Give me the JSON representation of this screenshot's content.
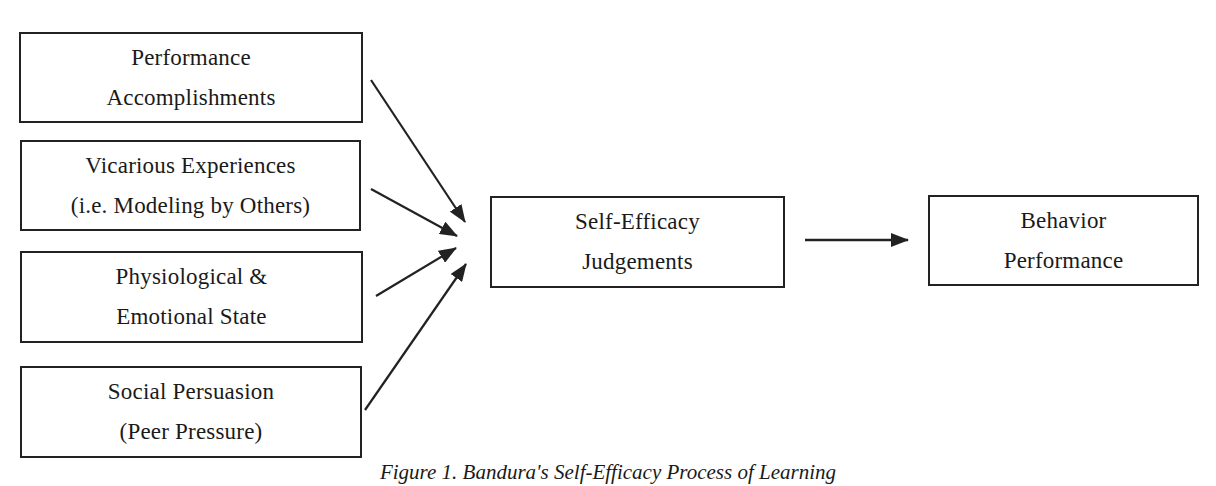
{
  "diagram": {
    "sources": [
      {
        "id": "performance-accomplishments",
        "lines": [
          "Performance",
          "Accomplishments"
        ]
      },
      {
        "id": "vicarious-experiences",
        "lines": [
          "Vicarious Experiences",
          "(i.e. Modeling by Others)"
        ]
      },
      {
        "id": "physiological-emotional-state",
        "lines": [
          "Physiological &",
          "Emotional State"
        ]
      },
      {
        "id": "social-persuasion",
        "lines": [
          "Social Persuasion",
          "(Peer Pressure)"
        ]
      }
    ],
    "center": {
      "id": "self-efficacy-judgements",
      "lines": [
        "Self-Efficacy",
        "Judgements"
      ]
    },
    "outcome": {
      "id": "behavior-performance",
      "lines": [
        "Behavior",
        "Performance"
      ]
    },
    "edges": [
      {
        "from": "performance-accomplishments",
        "to": "self-efficacy-judgements"
      },
      {
        "from": "vicarious-experiences",
        "to": "self-efficacy-judgements"
      },
      {
        "from": "physiological-emotional-state",
        "to": "self-efficacy-judgements"
      },
      {
        "from": "social-persuasion",
        "to": "self-efficacy-judgements"
      },
      {
        "from": "self-efficacy-judgements",
        "to": "behavior-performance"
      }
    ],
    "caption": "Figure 1. Bandura's Self-Efficacy Process of Learning"
  },
  "colors": {
    "stroke": "#222222",
    "text": "#1a1a1a",
    "background": "#ffffff"
  }
}
